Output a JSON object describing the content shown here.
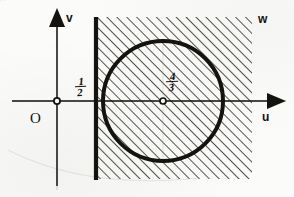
{
  "figure": {
    "background_color": "#fbfbf9",
    "ink_color": "#15130f",
    "width": 294,
    "height": 197
  },
  "axes": {
    "horizontal": {
      "name": "u-axis",
      "label": "u",
      "arrowhead": "right-filled-triangle",
      "y_pixel": 101
    },
    "vertical": {
      "name": "v-axis",
      "label": "v",
      "arrowhead": "up-filled-triangle",
      "x_pixel": 57
    },
    "origin": {
      "label": "O",
      "marker": "open-circle",
      "x_pixel": 57,
      "y_pixel": 101
    }
  },
  "region": {
    "label": "w",
    "fill": "diagonal-hatching",
    "hatch_angle_deg": 45,
    "boundary_line": {
      "name": "vertical-boundary-line",
      "orientation": "vertical",
      "style": "thick-solid",
      "value_label_numerator": "1",
      "value_label_denominator": "2",
      "x_pixel": 96
    },
    "bounds_pixels": {
      "left": 96,
      "top": 17,
      "right": 252,
      "bottom": 179
    }
  },
  "circle": {
    "name": "boundary-circle",
    "stroke": "thick-solid",
    "center_label_numerator": "4",
    "center_label_denominator": "3",
    "center_marker": "open-circle",
    "center_pixel": {
      "x": 163,
      "y": 101
    },
    "radius_pixel": 60
  }
}
